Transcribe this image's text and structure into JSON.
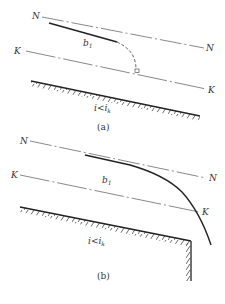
{
  "figure": {
    "panels": [
      {
        "id": "a",
        "caption": "(a)",
        "normal_depth_line": {
          "label_left": "N",
          "label_right": "N"
        },
        "critical_depth_line": {
          "label_left": "K",
          "label_right": "K"
        },
        "profile": {
          "label": "b",
          "subscript": "1",
          "style": "solid then dashed toward critical depth"
        },
        "slope_condition": {
          "main": "i<i",
          "subscript": "k"
        },
        "marker": "right-angle square at critical depth intersection"
      },
      {
        "id": "b",
        "caption": "(b)",
        "normal_depth_line": {
          "label_left": "N",
          "label_right": "N"
        },
        "critical_depth_line": {
          "label_left": "K",
          "label_right": "K"
        },
        "profile": {
          "label": "b",
          "subscript": "1",
          "style": "solid drawdown curve over free overfall"
        },
        "slope_condition": {
          "main": "i<i",
          "subscript": "k"
        },
        "marker": "vertical drop wall at channel end"
      }
    ],
    "colors": {
      "line": "#333333",
      "profile": "#222222",
      "background": "#ffffff"
    }
  }
}
